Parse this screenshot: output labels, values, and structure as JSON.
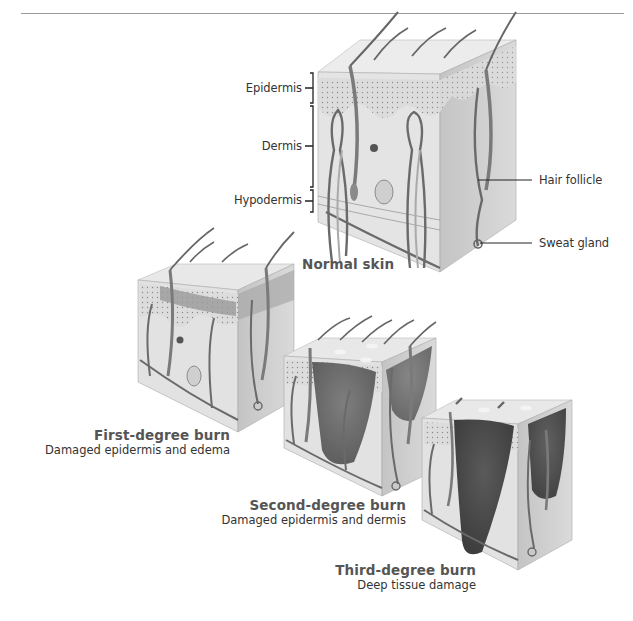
{
  "diagram": {
    "normal_skin": {
      "title": "Normal skin",
      "layer_labels": [
        "Epidermis",
        "Dermis",
        "Hypodermis"
      ],
      "structure_labels": [
        "Hair follicle",
        "Sweat gland"
      ]
    },
    "burns": [
      {
        "title": "First-degree burn",
        "description": "Damaged epidermis and edema"
      },
      {
        "title": "Second-degree burn",
        "description": "Damaged epidermis and dermis"
      },
      {
        "title": "Third-degree burn",
        "description": "Deep tissue damage"
      }
    ],
    "colors": {
      "skin_light": "#e6e6e6",
      "skin_side": "#cfcfcf",
      "vessel": "#6e6e6e",
      "damage_first": "#9a9a9a",
      "damage_second": "#6f6f6f",
      "damage_third": "#4f4f4f",
      "rule": "#9a9a9a"
    }
  }
}
